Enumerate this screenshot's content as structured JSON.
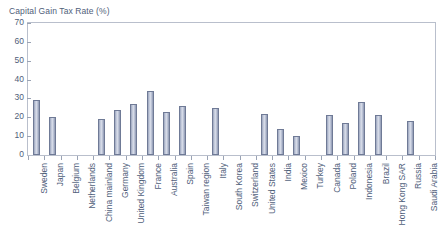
{
  "chart_data": {
    "type": "bar",
    "title": "Capital Gain Tax Rate (%)",
    "xlabel": "",
    "ylabel": "",
    "ylim": [
      0,
      70
    ],
    "yticks": [
      0,
      10,
      20,
      30,
      40,
      50,
      60,
      70
    ],
    "grid": false,
    "legend": null,
    "bar_color": "#c3cadb",
    "bar_edge_color": "#6f7a96",
    "text_color": "#50607a",
    "frame_color": "#b9bfcc",
    "categories": [
      "Sweden",
      "Japan",
      "Belgium",
      "Netherlands",
      "China mainland",
      "Germany",
      "United Kingdom",
      "France",
      "Australia",
      "Spain",
      "Taiwan region",
      "Italy",
      "South Korea",
      "Switzerland",
      "United States",
      "India",
      "Mexico",
      "Turkey",
      "Canada",
      "Poland",
      "Indonesia",
      "Brazil",
      "Hong Kong SAR",
      "Russia",
      "Saudi Arabia"
    ],
    "values": [
      29,
      20,
      0,
      0,
      19,
      24,
      27,
      34,
      23,
      26,
      0,
      25,
      0,
      0,
      22,
      14,
      10,
      0,
      21,
      17,
      28,
      21,
      0,
      18,
      0
    ]
  }
}
